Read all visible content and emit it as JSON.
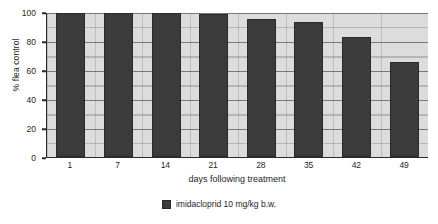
{
  "chart_data": {
    "type": "bar",
    "title": "",
    "xlabel": "days following treatment",
    "ylabel": "% flea control",
    "categories": [
      "1",
      "7",
      "14",
      "21",
      "28",
      "35",
      "42",
      "49"
    ],
    "series": [
      {
        "name": "imidacloprid 10 mg/kg b.w.",
        "color": "#3b3b3b",
        "values": [
          100,
          100,
          100,
          99,
          96,
          93.5,
          83,
          66
        ]
      }
    ],
    "ylim": [
      0,
      100
    ],
    "yticks": [
      0,
      20,
      40,
      60,
      80,
      100
    ],
    "ytick_labels": [
      "0",
      "20",
      "40",
      "60",
      "80",
      "100"
    ],
    "grid": true,
    "grid_minor": true,
    "legend_position": "bottom",
    "plot_background": "#dcdcdc",
    "axis_color": "#2b2b2b"
  },
  "legend": {
    "entries": [
      {
        "label": "imidacloprid 10 mg/kg b.w.",
        "color": "#3b3b3b"
      }
    ]
  }
}
